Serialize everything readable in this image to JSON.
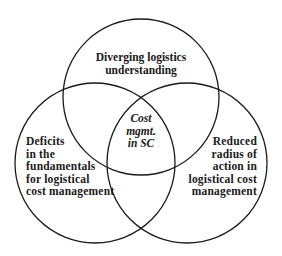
{
  "diagram": {
    "type": "venn-3",
    "stroke_color": "#1a1a1a",
    "background": "#ffffff",
    "circles": [
      {
        "id": "top",
        "cx": 141,
        "cy": 97,
        "r": 78
      },
      {
        "id": "left",
        "cx": 95,
        "cy": 163,
        "r": 80
      },
      {
        "id": "right",
        "cx": 187,
        "cy": 163,
        "r": 80
      }
    ],
    "top": {
      "lines": [
        "Diverging logistics",
        "understanding"
      ]
    },
    "left": {
      "lines": [
        "Deficits",
        "in the",
        "fundamentals",
        "for logistical",
        "cost management"
      ]
    },
    "right": {
      "lines": [
        "Reduced",
        "radius of",
        "action in",
        "logistical cost",
        "management"
      ]
    },
    "center": {
      "lines": [
        "Cost",
        "mgmt.",
        "in SC"
      ]
    }
  }
}
